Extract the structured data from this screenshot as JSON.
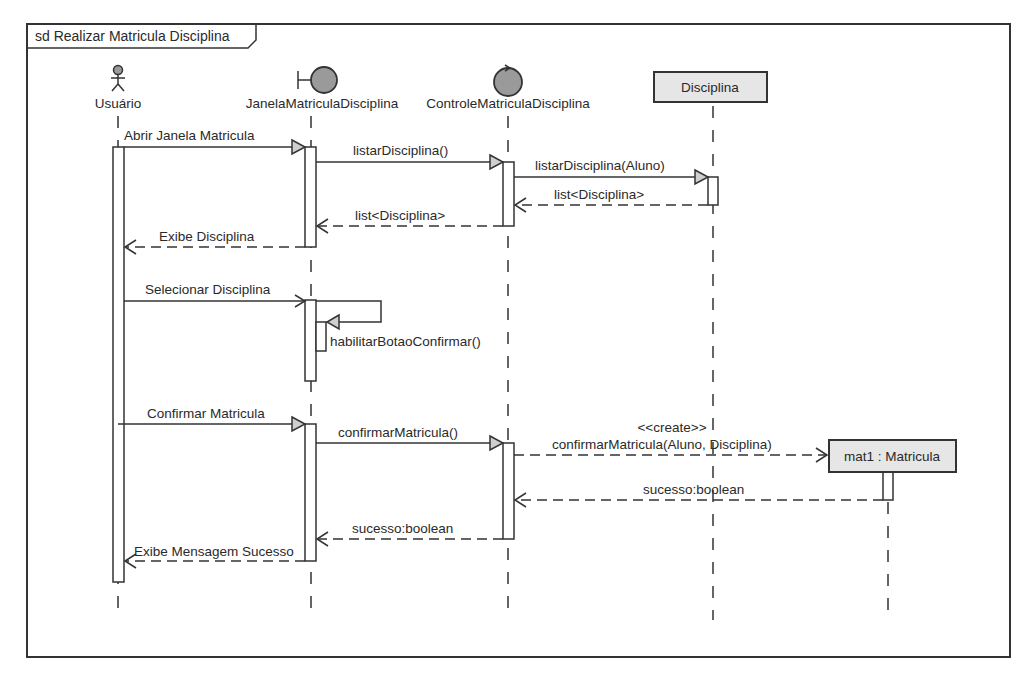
{
  "frame": {
    "title": "sd Realizar Matricula Disciplina"
  },
  "lifelines": [
    {
      "id": "usuario",
      "label": "Usuário",
      "kind": "actor",
      "icon": "actor-icon"
    },
    {
      "id": "janela",
      "label": "JanelaMatriculaDisciplina",
      "kind": "boundary",
      "icon": "boundary-icon"
    },
    {
      "id": "controle",
      "label": "ControleMatriculaDisciplina",
      "kind": "control",
      "icon": "control-icon"
    },
    {
      "id": "disciplina",
      "label": "Disciplina",
      "kind": "object"
    },
    {
      "id": "mat1",
      "label": "mat1 : Matricula",
      "kind": "created-object"
    }
  ],
  "messages": [
    {
      "label": "Abrir Janela Matricula",
      "from": "usuario",
      "to": "janela",
      "type": "sync"
    },
    {
      "label": "listarDisciplina()",
      "from": "janela",
      "to": "controle",
      "type": "sync"
    },
    {
      "label": "listarDisciplina(Aluno)",
      "from": "controle",
      "to": "disciplina",
      "type": "sync"
    },
    {
      "label": "list<Disciplina>",
      "from": "disciplina",
      "to": "controle",
      "type": "return"
    },
    {
      "label": "list<Disciplina>",
      "from": "controle",
      "to": "janela",
      "type": "return"
    },
    {
      "label": "Exibe Disciplina",
      "from": "janela",
      "to": "usuario",
      "type": "return"
    },
    {
      "label": "Selecionar Disciplina",
      "from": "usuario",
      "to": "janela",
      "type": "async"
    },
    {
      "label": "habilitarBotaoConfirmar()",
      "from": "janela",
      "to": "janela",
      "type": "self"
    },
    {
      "label": "Confirmar Matricula",
      "from": "usuario",
      "to": "janela",
      "type": "sync"
    },
    {
      "label": "confirmarMatricula()",
      "from": "janela",
      "to": "controle",
      "type": "sync"
    },
    {
      "label": "confirmarMatricula(Aluno, Disciplina)",
      "stereotype": "<<create>>",
      "from": "controle",
      "to": "mat1",
      "type": "create"
    },
    {
      "label": "sucesso:boolean",
      "from": "mat1",
      "to": "controle",
      "type": "return"
    },
    {
      "label": "sucesso:boolean",
      "from": "controle",
      "to": "janela",
      "type": "return"
    },
    {
      "label": "Exibe Mensagem Sucesso",
      "from": "janela",
      "to": "usuario",
      "type": "return"
    }
  ]
}
